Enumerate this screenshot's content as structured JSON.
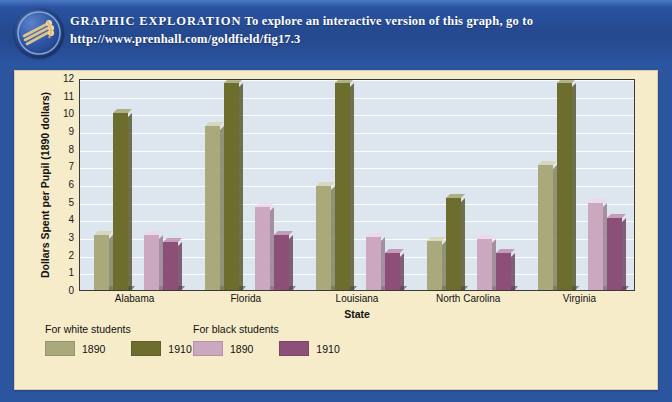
{
  "banner": {
    "title": "GRAPHIC  EXPLORATION",
    "body": "To explore an interactive version of this graph, go to",
    "url": "http://www.prenhall.com/goldfield/fig17.3",
    "icon": "globe-icon",
    "background_color": "#2a55a4"
  },
  "card": {
    "background_color": "#f7ecca"
  },
  "chart_data": {
    "type": "bar",
    "title": "",
    "xlabel": "State",
    "ylabel": "Dollars Spent per Pupil (1890 dollars)",
    "categories": [
      "Alabama",
      "Florida",
      "Louisiana",
      "North Carolina",
      "Virginia"
    ],
    "ylim": [
      0,
      12
    ],
    "yticks": [
      0,
      1,
      2,
      3,
      4,
      5,
      6,
      7,
      8,
      9,
      10,
      11,
      12
    ],
    "grid": true,
    "legend_position": "below",
    "plot_background": "#dde6ee",
    "series": [
      {
        "name": "1890",
        "group": "For white students",
        "color": "#a9a97c",
        "values": [
          3.1,
          9.3,
          5.9,
          2.8,
          7.1
        ]
      },
      {
        "name": "1910",
        "group": "For white students",
        "color": "#6d6d2d",
        "values": [
          10.0,
          11.7,
          11.7,
          5.2,
          11.7
        ]
      },
      {
        "name": "1890",
        "group": "For black students",
        "color": "#cba8c0",
        "values": [
          3.1,
          4.7,
          3.0,
          2.9,
          4.9
        ]
      },
      {
        "name": "1910",
        "group": "For black students",
        "color": "#8c5078",
        "values": [
          2.7,
          3.1,
          2.1,
          2.1,
          4.1
        ]
      }
    ]
  },
  "legend": {
    "groups": [
      {
        "heading": "For white students",
        "entries": [
          {
            "label": "1890",
            "color": "#a9a97c"
          },
          {
            "label": "1910",
            "color": "#6d6d2d"
          }
        ]
      },
      {
        "heading": "For black students",
        "entries": [
          {
            "label": "1890",
            "color": "#cba8c0"
          },
          {
            "label": "1910",
            "color": "#8c5078"
          }
        ]
      }
    ]
  }
}
